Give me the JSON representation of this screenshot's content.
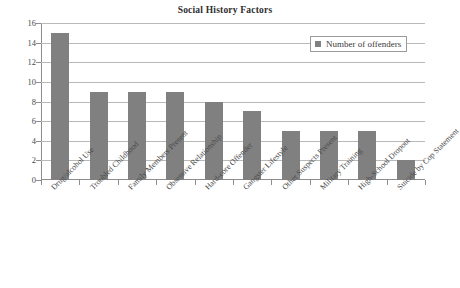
{
  "chart_data": {
    "type": "bar",
    "title": "Social History Factors",
    "xlabel": "",
    "ylabel": "",
    "ylim": [
      0,
      16
    ],
    "ytick_step": 2,
    "yticks": [
      16,
      14,
      12,
      10,
      8,
      6,
      4,
      2,
      0
    ],
    "grid": true,
    "legend_position": "top-right",
    "categories": [
      "Drug/alcohol Use",
      "Troubled Childhood",
      "Family Members Present",
      "Obsessive Relationship",
      "Hard-core Offender",
      "Gangster Lifestyle",
      "Other Suspects Present",
      "Military Training",
      "High-School Dropout",
      "Suicide by Cop Statement"
    ],
    "values": [
      15,
      9,
      9,
      9,
      8,
      7,
      5,
      5,
      5,
      2
    ],
    "series": [
      {
        "name": "Number of offenders",
        "values": [
          15,
          9,
          9,
          9,
          8,
          7,
          5,
          5,
          5,
          2
        ],
        "color": "#808080"
      }
    ]
  },
  "legend": {
    "entries": [
      {
        "label": "Number of offenders",
        "color": "#808080",
        "marker": "square-marker"
      }
    ]
  },
  "colors": {
    "bar": "#808080",
    "gridline": "#b9b9b9",
    "axis": "#8d8d8d",
    "text": "#3a3a3a",
    "background": "#ffffff"
  }
}
